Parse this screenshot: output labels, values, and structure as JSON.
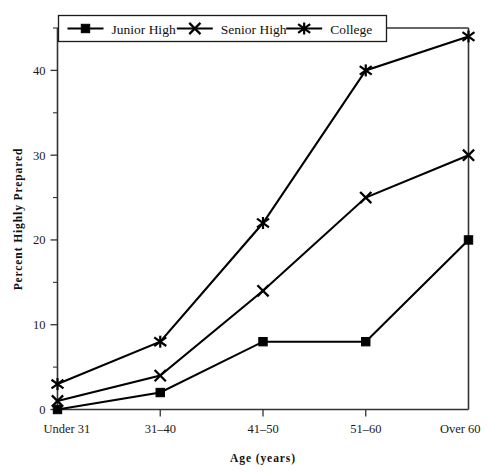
{
  "chart_data": {
    "type": "line",
    "title": "",
    "xlabel": "Age  (years)",
    "ylabel": "Percent Highly Prepared",
    "categories": [
      "Under 31",
      "31–40",
      "41–50",
      "51–60",
      "Over 60"
    ],
    "ylim": [
      0,
      45
    ],
    "yticks": [
      0,
      10,
      20,
      30,
      40
    ],
    "ytick_labels": [
      "0",
      "10",
      "20",
      "30",
      "40"
    ],
    "yminor_step": 5,
    "grid": false,
    "legend_position": "top-left",
    "series": [
      {
        "name": "Junior High",
        "marker": "filled-square",
        "values": [
          0,
          2,
          8,
          8,
          20
        ]
      },
      {
        "name": "Senior High",
        "marker": "x-cross",
        "values": [
          1,
          4,
          14,
          25,
          30
        ]
      },
      {
        "name": "College",
        "marker": "six-point-asterisk",
        "values": [
          3,
          8,
          22,
          40,
          44
        ]
      }
    ],
    "colors": {
      "line": "#000000",
      "axis": "#333333",
      "text": "#111111",
      "background": "#ffffff"
    }
  }
}
